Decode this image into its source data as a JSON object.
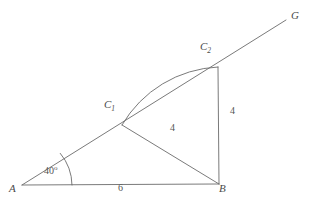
{
  "figure": {
    "kind": "geometry-diagram",
    "background_color": "#ffffff",
    "stroke_color": "#6b6b6b",
    "text_color": "#4a4a4a"
  },
  "vertices": {
    "a": {
      "name": "A",
      "label": "A",
      "x": 22,
      "y": 185,
      "label_x": 9,
      "label_y": 189
    },
    "b": {
      "name": "B",
      "label": "B",
      "x": 219,
      "y": 184,
      "label_x": 219,
      "label_y": 189
    },
    "c1": {
      "name": "C1",
      "label_main": "C",
      "label_sub": "1",
      "x": 122,
      "y": 125,
      "label_x": 104,
      "label_y": 104
    },
    "c2": {
      "name": "C2",
      "label_main": "C",
      "label_sub": "2",
      "x": 218,
      "y": 67,
      "label_x": 200,
      "label_y": 46
    },
    "g": {
      "name": "G",
      "label": "G",
      "x": 286,
      "y": 20,
      "label_x": 292,
      "label_y": 12
    }
  },
  "measures": {
    "angle_a": {
      "value": "40",
      "degree_symbol": "o",
      "label_x": 44,
      "label_y": 170
    },
    "side_ab": {
      "label": "6",
      "label_x": 118,
      "label_y": 188
    },
    "side_c1b": {
      "label": "4",
      "label_x": 170,
      "label_y": 128
    },
    "side_c2b": {
      "label": "4",
      "label_x": 230,
      "label_y": 111
    }
  },
  "segments": [
    {
      "name": "base-segment-ab",
      "from": "A",
      "to": "B"
    },
    {
      "name": "ray-ag-through-c1-c2",
      "from": "A",
      "to": "G"
    },
    {
      "name": "segment-c1-b",
      "from": "C1",
      "to": "B"
    },
    {
      "name": "segment-c2-b",
      "from": "C2",
      "to": "B"
    }
  ],
  "arcs": [
    {
      "name": "angle-arc-at-a",
      "center": "A",
      "radius": 50
    },
    {
      "name": "construction-arc-c1-to-c2",
      "center": "B",
      "radius": 117
    }
  ]
}
